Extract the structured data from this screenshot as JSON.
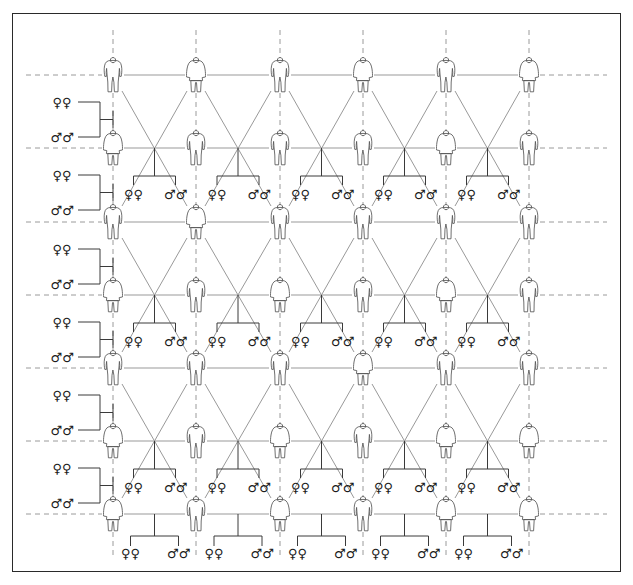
{
  "diagram": {
    "type": "genealogical-lattice",
    "frame": {
      "x": 12,
      "y": 13,
      "width": 609,
      "height": 559,
      "border_color": "#2a2a2a"
    },
    "colors": {
      "line": "#999999",
      "dashed_line": "#9a9a9a",
      "bracket": "#3a3a3a",
      "symbol": "#1c1c1c",
      "figure_outline": "#4a4a4a",
      "background": "#ffffff"
    },
    "grid": {
      "columns": 6,
      "rows": 7,
      "column_x": [
        113,
        196,
        280,
        363,
        446,
        529
      ],
      "row_y": [
        75,
        148,
        222,
        295,
        368,
        441,
        514
      ],
      "col_spacing": 83,
      "row_spacing": 73
    },
    "person_figures": {
      "icon_male": "male-person-icon",
      "icon_female": "female-person-icon",
      "row_genders": [
        [
          "male",
          "female",
          "male",
          "female",
          "male",
          "female"
        ],
        [
          "female",
          "male",
          "male",
          "male",
          "female",
          "male"
        ],
        [
          "male",
          "female",
          "male",
          "male",
          "male",
          "male"
        ],
        [
          "female",
          "male",
          "female",
          "male",
          "female",
          "male"
        ],
        [
          "male",
          "male",
          "male",
          "female",
          "male",
          "male"
        ],
        [
          "female",
          "male",
          "female",
          "male",
          "female",
          "female"
        ],
        [
          "female",
          "male",
          "female",
          "male",
          "female",
          "female"
        ]
      ]
    },
    "symbols": {
      "female_pair": "♀♀",
      "male_pair": "♂♂",
      "female_glyph": "♀",
      "male_glyph": "♂"
    },
    "left_marriage_brackets": [
      {
        "index": 0,
        "top_label": "♀♀",
        "bottom_label": "♂♂",
        "top_y": 102,
        "bottom_y": 137,
        "target_row": 1
      },
      {
        "index": 1,
        "top_label": "♀♀",
        "bottom_label": "♂♂",
        "top_y": 175,
        "bottom_y": 210,
        "target_row": 2
      },
      {
        "index": 2,
        "top_label": "♀♀",
        "bottom_label": "♂♂",
        "top_y": 249,
        "bottom_y": 284,
        "target_row": 3
      },
      {
        "index": 3,
        "top_label": "♀♀",
        "bottom_label": "♂♂",
        "top_y": 322,
        "bottom_y": 357,
        "target_row": 4
      },
      {
        "index": 4,
        "top_label": "♀♀",
        "bottom_label": "♂♂",
        "top_y": 395,
        "bottom_y": 430,
        "target_row": 5
      },
      {
        "index": 5,
        "top_label": "♀♀",
        "bottom_label": "♂♂",
        "top_y": 468,
        "bottom_y": 503,
        "target_row": 6
      }
    ],
    "offspring_groups": {
      "label_female": "♀♀",
      "label_male": "♂♂",
      "rows_y": [
        207,
        344,
        482
      ],
      "bottom_row_y": 553,
      "intersection_count_per_row": 5,
      "bottom_group_count": 5
    },
    "chart_data": {
      "type": "diagram",
      "description": "Lattice of human figures arranged in a 6-column by 7-row grid, connected by horizontal solid lines, diagonal crossing lines forming X patterns between adjacent columns and rows, and dashed lines extending beyond the left and right boundaries indicating lattice continuation.",
      "nodes": 42,
      "offspring_labels_total": 20
    }
  }
}
